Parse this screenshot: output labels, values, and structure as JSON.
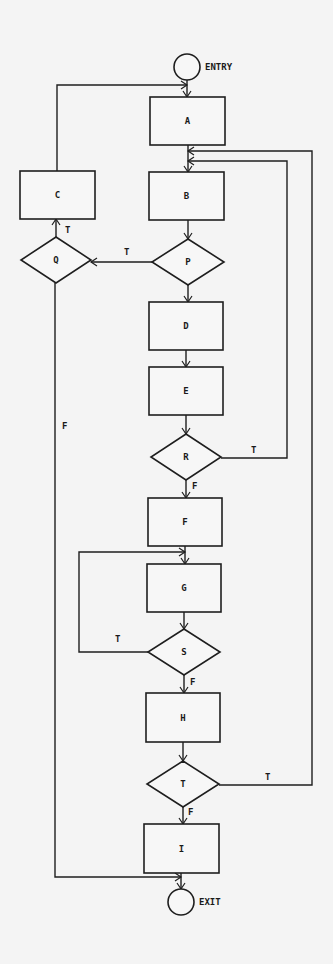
{
  "diagram": {
    "type": "flowchart",
    "terminals": {
      "entry": {
        "label": "ENTRY",
        "cx": 187,
        "cy": 67,
        "r": 13
      },
      "exit": {
        "label": "EXIT",
        "cx": 181,
        "cy": 902,
        "r": 13
      }
    },
    "processes": [
      {
        "id": "A",
        "label": "A",
        "x": 150,
        "y": 97,
        "w": 75,
        "h": 48
      },
      {
        "id": "B",
        "label": "B",
        "x": 149,
        "y": 172,
        "w": 75,
        "h": 48
      },
      {
        "id": "C",
        "label": "C",
        "x": 20,
        "y": 171,
        "w": 75,
        "h": 48
      },
      {
        "id": "D",
        "label": "D",
        "x": 149,
        "y": 302,
        "w": 74,
        "h": 48
      },
      {
        "id": "E",
        "label": "E",
        "x": 149,
        "y": 367,
        "w": 74,
        "h": 48
      },
      {
        "id": "F",
        "label": "F",
        "x": 148,
        "y": 498,
        "w": 74,
        "h": 48
      },
      {
        "id": "G",
        "label": "G",
        "x": 147,
        "y": 564,
        "w": 74,
        "h": 48
      },
      {
        "id": "H",
        "label": "H",
        "x": 146,
        "y": 693,
        "w": 74,
        "h": 49
      },
      {
        "id": "I",
        "label": "I",
        "x": 144,
        "y": 824,
        "w": 75,
        "h": 49
      }
    ],
    "decisions": [
      {
        "id": "Q",
        "label": "Q",
        "cx": 56,
        "cy": 260,
        "hw": 35,
        "hh": 23
      },
      {
        "id": "P",
        "label": "P",
        "cx": 188,
        "cy": 262,
        "hw": 36,
        "hh": 23
      },
      {
        "id": "R",
        "label": "R",
        "cx": 186,
        "cy": 457,
        "hw": 35,
        "hh": 23
      },
      {
        "id": "S",
        "label": "S",
        "cx": 184,
        "cy": 652,
        "hw": 36,
        "hh": 23
      },
      {
        "id": "T",
        "label": "T",
        "cx": 183,
        "cy": 784,
        "hw": 36,
        "hh": 23
      }
    ],
    "edge_labels": [
      {
        "text": "T",
        "x": 65,
        "y": 233,
        "of": "Q-true"
      },
      {
        "text": "T",
        "x": 124,
        "y": 255,
        "of": "P-true"
      },
      {
        "text": "F",
        "x": 62,
        "y": 429,
        "of": "Q-false"
      },
      {
        "text": "T",
        "x": 251,
        "y": 453,
        "of": "R-true"
      },
      {
        "text": "F",
        "x": 192,
        "y": 489,
        "of": "R-false"
      },
      {
        "text": "T",
        "x": 115,
        "y": 642,
        "of": "S-true"
      },
      {
        "text": "F",
        "x": 190,
        "y": 685,
        "of": "S-false"
      },
      {
        "text": "T",
        "x": 265,
        "y": 780,
        "of": "T-true"
      },
      {
        "text": "F",
        "x": 188,
        "y": 815,
        "of": "T-false"
      }
    ],
    "edges": [
      {
        "from": "ENTRY",
        "to": "A"
      },
      {
        "from": "A",
        "to": "B"
      },
      {
        "from": "B",
        "to": "P"
      },
      {
        "from": "P",
        "to": "Q",
        "label": "T"
      },
      {
        "from": "P",
        "to": "D",
        "label": "F"
      },
      {
        "from": "Q",
        "to": "C",
        "label": "T"
      },
      {
        "from": "Q",
        "to": "EXIT",
        "label": "F"
      },
      {
        "from": "C",
        "to": "A"
      },
      {
        "from": "D",
        "to": "E"
      },
      {
        "from": "E",
        "to": "R"
      },
      {
        "from": "R",
        "to": "B",
        "label": "T"
      },
      {
        "from": "R",
        "to": "F",
        "label": "F"
      },
      {
        "from": "F",
        "to": "G"
      },
      {
        "from": "G",
        "to": "S"
      },
      {
        "from": "S",
        "to": "G",
        "label": "T"
      },
      {
        "from": "S",
        "to": "H",
        "label": "F"
      },
      {
        "from": "H",
        "to": "T"
      },
      {
        "from": "T",
        "to": "B",
        "label": "T"
      },
      {
        "from": "T",
        "to": "I",
        "label": "F"
      },
      {
        "from": "I",
        "to": "EXIT"
      }
    ]
  }
}
